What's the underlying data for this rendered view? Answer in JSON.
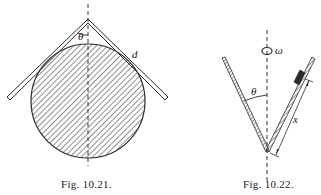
{
  "figures": [
    {
      "id": "fig-10-21",
      "caption": "Fig. 10.21.",
      "labels": {
        "angle": "θ",
        "distance": "d"
      },
      "description": "Inverted V-shaped rod resting on a hatched circular cylinder, with vertical dashed symmetry axis"
    },
    {
      "id": "fig-10-22",
      "caption": "Fig. 10.22.",
      "labels": {
        "angle": "θ",
        "omega": "ω",
        "distance": "x"
      },
      "description": "V-shaped cone rotating about vertical dashed axis with angular velocity ω; small block on the right arm at distance x from apex"
    }
  ],
  "colors": {
    "ink": "#2a2a2a",
    "background": "#ffffff"
  }
}
